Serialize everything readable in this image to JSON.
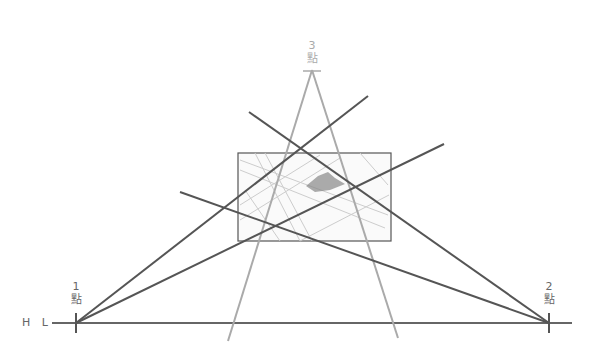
{
  "labels": {
    "horizon": "H L",
    "vp1": {
      "num": "1",
      "char": "點"
    },
    "vp2": {
      "num": "2",
      "char": "點"
    },
    "vp3": {
      "num": "3",
      "char": "點"
    }
  },
  "colors": {
    "dark_line": "#555555",
    "gray_line": "#aaaaaa",
    "frame": "#555555"
  },
  "points": {
    "vp1": [
      76,
      323
    ],
    "vp2": [
      549,
      323
    ],
    "vp3": [
      312,
      70
    ]
  }
}
